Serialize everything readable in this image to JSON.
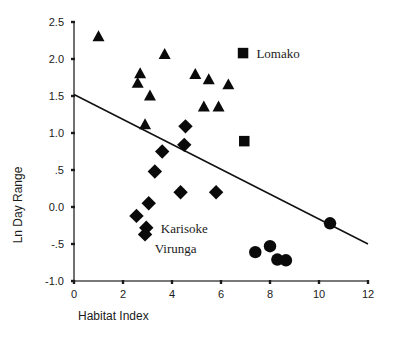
{
  "chart_data": {
    "type": "scatter",
    "title": "",
    "xlabel": "Habitat Index",
    "ylabel": "Ln Day Range",
    "xlim": [
      0,
      12
    ],
    "ylim": [
      -1.0,
      2.5
    ],
    "xticks": [
      "0",
      "2",
      "4",
      "6",
      "8",
      "10",
      "12"
    ],
    "xtick_values": [
      0,
      2,
      4,
      6,
      8,
      10,
      12
    ],
    "yticks": [
      "2.5",
      "2.0",
      "1.5",
      "1.0",
      ".5",
      "0.0",
      "-.5",
      "-1.0"
    ],
    "ytick_values": [
      2.5,
      2.0,
      1.5,
      1.0,
      0.5,
      0.0,
      -0.5,
      -1.0
    ],
    "grid": false,
    "legend": false,
    "series": [
      {
        "name": "triangles",
        "marker": "triangle",
        "color": "#0a0a0a",
        "points": [
          {
            "x": 1.0,
            "y": 2.3
          },
          {
            "x": 3.7,
            "y": 2.06
          },
          {
            "x": 2.7,
            "y": 1.8
          },
          {
            "x": 2.6,
            "y": 1.67
          },
          {
            "x": 4.95,
            "y": 1.79
          },
          {
            "x": 5.5,
            "y": 1.72
          },
          {
            "x": 6.3,
            "y": 1.65
          },
          {
            "x": 3.1,
            "y": 1.5
          },
          {
            "x": 5.3,
            "y": 1.35
          },
          {
            "x": 5.9,
            "y": 1.35
          },
          {
            "x": 2.9,
            "y": 1.11
          }
        ]
      },
      {
        "name": "squares",
        "marker": "square",
        "color": "#0a0a0a",
        "points": [
          {
            "x": 6.9,
            "y": 2.08
          },
          {
            "x": 6.95,
            "y": 0.89
          }
        ]
      },
      {
        "name": "diamonds",
        "marker": "diamond",
        "color": "#0a0a0a",
        "points": [
          {
            "x": 4.55,
            "y": 1.09
          },
          {
            "x": 4.5,
            "y": 0.84
          },
          {
            "x": 3.6,
            "y": 0.75
          },
          {
            "x": 3.3,
            "y": 0.48
          },
          {
            "x": 4.35,
            "y": 0.2
          },
          {
            "x": 5.8,
            "y": 0.2
          },
          {
            "x": 3.05,
            "y": 0.05
          },
          {
            "x": 2.55,
            "y": -0.12
          },
          {
            "x": 2.95,
            "y": -0.28
          },
          {
            "x": 2.9,
            "y": -0.37
          }
        ]
      },
      {
        "name": "circles",
        "marker": "circle",
        "color": "#0a0a0a",
        "points": [
          {
            "x": 10.45,
            "y": -0.22
          },
          {
            "x": 8.0,
            "y": -0.53
          },
          {
            "x": 7.4,
            "y": -0.61
          },
          {
            "x": 8.3,
            "y": -0.71
          },
          {
            "x": 8.65,
            "y": -0.72
          }
        ]
      }
    ],
    "trendline": {
      "name": "regression-line",
      "x0": 0.0,
      "y0": 1.52,
      "x1": 12.0,
      "y1": -0.5
    },
    "annotations": [
      {
        "name": "lomako",
        "text": "Lomako",
        "x": 7.2,
        "y": 2.08
      },
      {
        "name": "karisoke",
        "text": "Karisoke",
        "x": 3.3,
        "y": -0.28
      },
      {
        "name": "virunga",
        "text": "Virunga",
        "x": 3.05,
        "y": -0.55
      }
    ]
  }
}
